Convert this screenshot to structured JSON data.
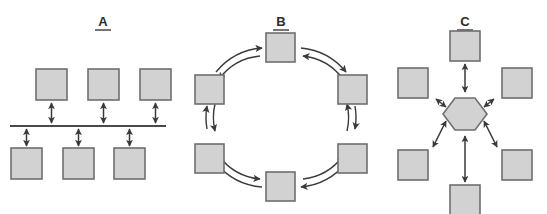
{
  "figure": {
    "title": "",
    "background_color": "#ffffff",
    "width": 547,
    "height": 214
  },
  "style": {
    "node_fill": "#d2d2d2",
    "node_stroke": "#6f6f6f",
    "arrow_color": "#3a3a3a",
    "line_color": "#4a4a4a",
    "label_color": "#2b2b2b"
  },
  "panels": [
    {
      "id": "A",
      "label": "A",
      "topology": "bus",
      "label_x": 103,
      "label_y": 26,
      "node_shape": "square",
      "node_size": 31,
      "node_count": 6,
      "connector": "double-headed-straight-arrow",
      "bus": {
        "x1": 10,
        "x2": 166,
        "y": 126
      },
      "nodes": [
        {
          "name": "node-a-top-1",
          "x": 36,
          "y": 69
        },
        {
          "name": "node-a-top-2",
          "x": 88,
          "y": 69
        },
        {
          "name": "node-a-top-3",
          "x": 140,
          "y": 69
        },
        {
          "name": "node-a-bottom-1",
          "x": 11,
          "y": 148
        },
        {
          "name": "node-a-bottom-2",
          "x": 63,
          "y": 148
        },
        {
          "name": "node-a-bottom-3",
          "x": 114,
          "y": 148
        }
      ],
      "arrows": [
        {
          "name": "arrow-a-top-1",
          "x": 51.5,
          "y1": 102,
          "y2": 123
        },
        {
          "name": "arrow-a-top-2",
          "x": 103.5,
          "y1": 102,
          "y2": 123
        },
        {
          "name": "arrow-a-top-3",
          "x": 155.5,
          "y1": 102,
          "y2": 123
        },
        {
          "name": "arrow-a-bottom-1",
          "x": 26.5,
          "y1": 129,
          "y2": 146
        },
        {
          "name": "arrow-a-bottom-2",
          "x": 78.5,
          "y1": 129,
          "y2": 146
        },
        {
          "name": "arrow-a-bottom-3",
          "x": 129.5,
          "y1": 129,
          "y2": 146
        }
      ]
    },
    {
      "id": "B",
      "label": "B",
      "topology": "ring",
      "label_x": 281,
      "label_y": 26,
      "node_shape": "square",
      "node_size": 29,
      "node_count": 6,
      "connector": "paired-curved-arrows",
      "ring": {
        "cx": 281,
        "cy": 117,
        "r": 63
      },
      "nodes": [
        {
          "name": "node-b-top",
          "x": 266,
          "y": 33
        },
        {
          "name": "node-b-upper-right",
          "x": 338,
          "y": 75
        },
        {
          "name": "node-b-lower-right",
          "x": 338,
          "y": 144
        },
        {
          "name": "node-b-bottom",
          "x": 266,
          "y": 172
        },
        {
          "name": "node-b-lower-left",
          "x": 195,
          "y": 144
        },
        {
          "name": "node-b-upper-left",
          "x": 195,
          "y": 75
        }
      ]
    },
    {
      "id": "C",
      "label": "C",
      "topology": "star",
      "label_x": 465,
      "label_y": 26,
      "node_shape": "square",
      "hub_shape": "hexagon",
      "node_size": 30,
      "node_count": 6,
      "connector": "double-headed-straight-arrow",
      "hub": {
        "name": "hub-c-hexagon",
        "cx": 465,
        "cy": 114,
        "r": 20
      },
      "nodes": [
        {
          "name": "node-c-top",
          "x": 450,
          "y": 31
        },
        {
          "name": "node-c-upper-right",
          "x": 502,
          "y": 68
        },
        {
          "name": "node-c-lower-right",
          "x": 502,
          "y": 150
        },
        {
          "name": "node-c-bottom",
          "x": 450,
          "y": 185
        },
        {
          "name": "node-c-lower-left",
          "x": 398,
          "y": 150
        },
        {
          "name": "node-c-upper-left",
          "x": 398,
          "y": 68
        }
      ]
    }
  ]
}
